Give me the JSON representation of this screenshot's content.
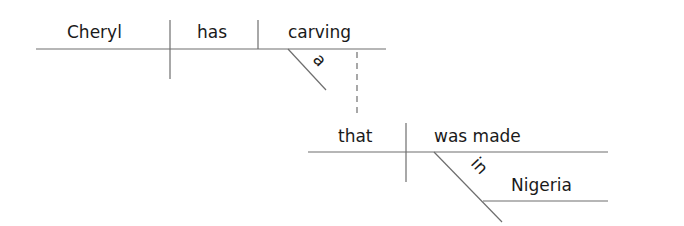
{
  "diagram": {
    "type": "sentence-diagram",
    "sentence": "Cheryl has a carving that was made in Nigeria",
    "main_clause": {
      "subject": "Cheryl",
      "verb": "has",
      "direct_object": "carving",
      "modifier": "a"
    },
    "relative_clause": {
      "subject": "that",
      "verb": "was made",
      "preposition": "in",
      "object_of_preposition": "Nigeria"
    },
    "colors": {
      "line": "#6e6e6e",
      "text": "#1a1a1a",
      "background": "#ffffff"
    }
  }
}
